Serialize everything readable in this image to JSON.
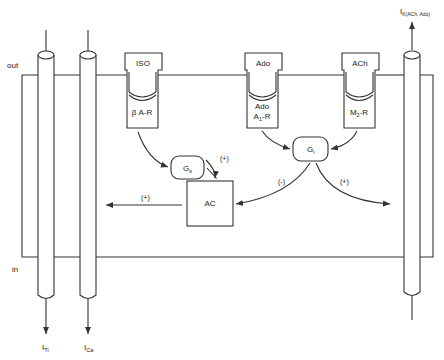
{
  "diagram": {
    "type": "cardiac myocyte signaling schematic",
    "colors": {
      "stroke": "#333333",
      "background": "#ffffff",
      "text": "#222222"
    },
    "compartments": {
      "outside_label": "out",
      "inside_label": "in"
    },
    "receptors": [
      {
        "id": "beta",
        "ligand": "ISO",
        "receptor_label": "β A-R",
        "receptor_sub": ""
      },
      {
        "id": "a1",
        "ligand": "Ado",
        "receptor_label_line1": "Ado",
        "receptor_label_main": "A",
        "receptor_label_sub": "1",
        "receptor_label_suffix": "-R"
      },
      {
        "id": "m2",
        "ligand": "ACh",
        "receptor_label_main": "M",
        "receptor_label_sub": "2",
        "receptor_label_suffix": "-R"
      }
    ],
    "g_proteins": [
      {
        "id": "gs",
        "main": "G",
        "sub": "s"
      },
      {
        "id": "gi",
        "main": "G",
        "sub": "i"
      }
    ],
    "enzyme": {
      "label": "AC"
    },
    "effects": {
      "gs_to_ac": "(+)",
      "ac_to_channels": "(+)",
      "gi_to_ac": "(-)",
      "gi_to_kach": "(+)"
    },
    "currents": [
      {
        "id": "ito",
        "main": "I",
        "sub": "Ti",
        "direction": "out-of-cell (down)"
      },
      {
        "id": "ica",
        "main": "I",
        "sub": "Ca",
        "direction": "out-of-cell (down)"
      },
      {
        "id": "ikach",
        "main": "I",
        "sub": "K(ACh, Ado)",
        "direction": "up"
      }
    ]
  }
}
